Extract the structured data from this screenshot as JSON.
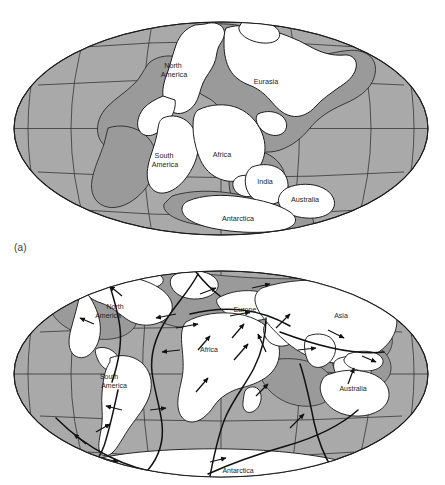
{
  "figure": {
    "type": "two-panel world map figure",
    "background_color": "#ffffff",
    "ocean_color": "#a9a9a9",
    "land_color": "#ffffff",
    "shelf_color": "#9a9a9a",
    "outline_color": "#1d1d1d",
    "graticule_color": "#3c3c3c",
    "plate_boundary_color": "#111111"
  },
  "panel_a": {
    "caption": "(a)",
    "title_hidden": "",
    "projection": "elliptical (Mollweide-style) world projection",
    "description": "Pangaea supercontinent reconstruction",
    "labels": [
      {
        "text": "North America",
        "lines": [
          "North",
          "America"
        ],
        "x": 174,
        "y": 68
      },
      {
        "text": "Eurasia",
        "lines": [
          "Eurasia"
        ],
        "x": 266,
        "y": 84
      },
      {
        "text": "South America",
        "lines": [
          "South",
          "America"
        ],
        "x": 165,
        "y": 158
      },
      {
        "text": "Africa",
        "lines": [
          "Africa"
        ],
        "x": 220,
        "y": 157
      },
      {
        "text": "India",
        "lines": [
          "India"
        ],
        "x": 263,
        "y": 183
      },
      {
        "text": "Australia",
        "lines": [
          "Australia"
        ],
        "x": 304,
        "y": 201
      },
      {
        "text": "Antarctica",
        "lines": [
          "Antarctica"
        ],
        "x": 238,
        "y": 221
      }
    ]
  },
  "panel_b": {
    "caption": "",
    "projection": "elliptical (Mollweide-style) world projection",
    "description": "Present-day continents with mid-ocean ridges, plate boundaries and plate-motion arrows",
    "labels": [
      {
        "text": "North America",
        "lines": [
          "North",
          "America"
        ],
        "x": 111,
        "y": 309
      },
      {
        "text": "Europe",
        "lines": [
          "Europe"
        ],
        "x": 244,
        "y": 312
      },
      {
        "text": "Asia",
        "lines": [
          "Asia"
        ],
        "x": 340,
        "y": 318
      },
      {
        "text": "Africa",
        "lines": [
          "Africa"
        ],
        "x": 209,
        "y": 352
      },
      {
        "text": "South America",
        "lines": [
          "South",
          "America"
        ],
        "x": 110,
        "y": 382
      },
      {
        "text": "Australia",
        "lines": [
          "Australia"
        ],
        "x": 353,
        "y": 388
      },
      {
        "text": "Antarctica",
        "lines": [
          "Antarctica"
        ],
        "x": 238,
        "y": 474
      }
    ],
    "motion_arrows_count": 26
  }
}
